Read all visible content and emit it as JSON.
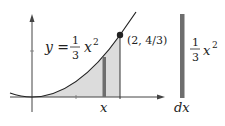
{
  "diagram": {
    "equation": {
      "lhs": "y =",
      "frac_num": "1",
      "frac_den": "3",
      "var": "x",
      "exp": "2"
    },
    "point_label": "(2, 4/3)",
    "x_label": "x",
    "slice": {
      "height_num": "1",
      "height_den": "3",
      "height_var": "x",
      "height_exp": "2",
      "width_label": "dx"
    },
    "colors": {
      "curve": "#222222",
      "shade": "#dcdcdc",
      "strip": "#6e6e6e",
      "axis": "#444444"
    }
  }
}
